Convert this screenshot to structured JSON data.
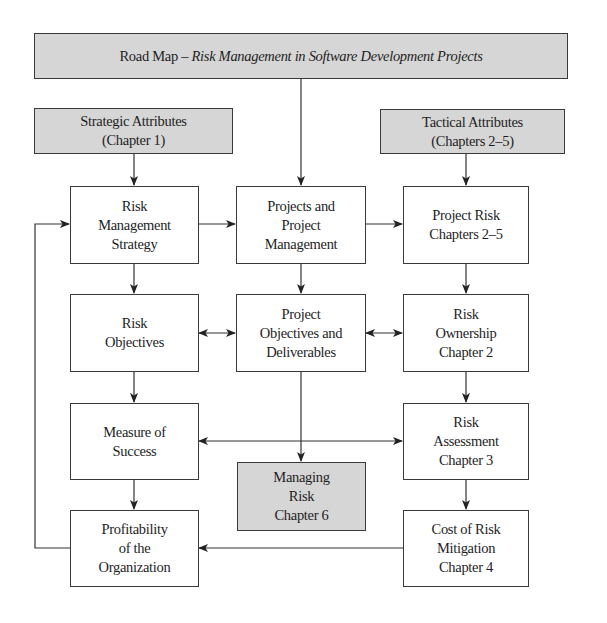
{
  "title": {
    "prefix": "Road Map – ",
    "italic": "Risk Management in Software Development Projects"
  },
  "nodes": {
    "strategic": "Strategic Attributes\n(Chapter 1)",
    "tactical": "Tactical Attributes\n(Chapters 2–5)",
    "risk_mgmt_strategy": "Risk\nManagement\nStrategy",
    "projects_pm": "Projects and\nProject\nManagement",
    "project_risk": "Project Risk\nChapters 2–5",
    "risk_objectives": "Risk\nObjectives",
    "project_objectives": "Project\nObjectives and\nDeliverables",
    "risk_ownership": "Risk\nOwnership\nChapter 2",
    "measure_success": "Measure of\nSuccess",
    "managing_risk": "Managing\nRisk\nChapter 6",
    "risk_assessment": "Risk\nAssessment\nChapter 3",
    "profitability": "Profitability\nof the\nOrganization",
    "cost_mitigation": "Cost of Risk\nMitigation\nChapter 4"
  },
  "edges": [
    {
      "from": "title",
      "to": "projects_pm",
      "type": "arrow"
    },
    {
      "from": "strategic",
      "to": "risk_mgmt_strategy",
      "type": "arrow"
    },
    {
      "from": "tactical",
      "to": "project_risk",
      "type": "arrow"
    },
    {
      "from": "risk_mgmt_strategy",
      "to": "projects_pm",
      "type": "arrow"
    },
    {
      "from": "projects_pm",
      "to": "project_risk",
      "type": "arrow"
    },
    {
      "from": "risk_mgmt_strategy",
      "to": "risk_objectives",
      "type": "arrow"
    },
    {
      "from": "projects_pm",
      "to": "project_objectives",
      "type": "arrow"
    },
    {
      "from": "project_risk",
      "to": "risk_ownership",
      "type": "arrow"
    },
    {
      "from": "risk_objectives",
      "to": "project_objectives",
      "type": "bidirectional"
    },
    {
      "from": "project_objectives",
      "to": "risk_ownership",
      "type": "bidirectional"
    },
    {
      "from": "risk_objectives",
      "to": "measure_success",
      "type": "arrow"
    },
    {
      "from": "project_objectives",
      "to": "managing_risk",
      "type": "arrow"
    },
    {
      "from": "risk_ownership",
      "to": "risk_assessment",
      "type": "arrow"
    },
    {
      "from": "measure_success",
      "to": "risk_assessment",
      "type": "bidirectional"
    },
    {
      "from": "measure_success",
      "to": "profitability",
      "type": "arrow"
    },
    {
      "from": "risk_assessment",
      "to": "cost_mitigation",
      "type": "arrow"
    },
    {
      "from": "cost_mitigation",
      "to": "profitability",
      "type": "arrow"
    },
    {
      "from": "profitability",
      "to": "risk_mgmt_strategy",
      "type": "feedback-arrow"
    }
  ],
  "colors": {
    "shaded_fill": "#d6d6d6",
    "border": "#3a3a3a",
    "line": "#333333"
  }
}
